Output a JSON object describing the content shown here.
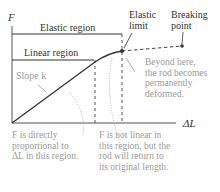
{
  "axes": {
    "y_label": "F",
    "x_label": "ΔL"
  },
  "regions": {
    "elastic": "Elastic region",
    "linear": "Linear region"
  },
  "points": {
    "elastic_limit": [
      "Elastic",
      "limit"
    ],
    "breaking_point": [
      "Breaking",
      "point"
    ]
  },
  "annotations": {
    "slope": "Slope k",
    "slope_k_symbol": "k",
    "beyond": [
      "Beyond here,",
      "the rod becomes",
      "permanently",
      "deformed."
    ],
    "linear_note": [
      "F is directly",
      "proportional to",
      "ΔL in this region."
    ],
    "nonlinear_note": [
      "F is not linear in",
      "this region, but the",
      "rod will return to",
      "its original length."
    ]
  },
  "colors": {
    "line": "#3a3a3a",
    "annotation": "#9a9a9a"
  }
}
